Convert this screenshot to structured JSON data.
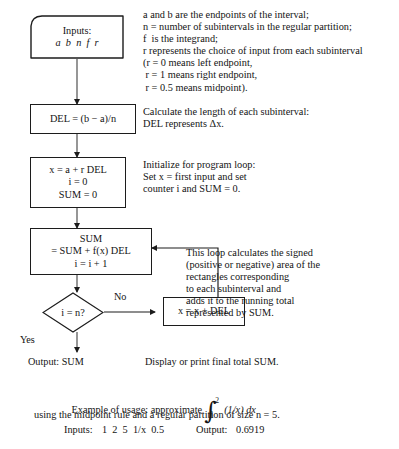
{
  "document": {
    "kind": "flowchart",
    "title": "Riemann sum approximation algorithm flowchart",
    "colors": {
      "background": "#ffffff",
      "ink": "#141414",
      "stroke": "#1c1c1c"
    }
  },
  "flowchart": {
    "nodes": {
      "inputs": {
        "shape": "input-parallelogram",
        "line1": "Inputs:",
        "line2": "a  b  n  f  r"
      },
      "del": {
        "shape": "process",
        "line1": "DEL = (b − a)/n"
      },
      "init": {
        "shape": "process",
        "line1": "x = a + r DEL",
        "line2": "i = 0",
        "line3": "SUM = 0"
      },
      "sum": {
        "shape": "process",
        "line1": "SUM",
        "line2": "= SUM + f(x) DEL",
        "line3": "i = i + 1"
      },
      "test": {
        "shape": "decision",
        "line1": "i = n?"
      },
      "increment": {
        "shape": "process",
        "line1": "x = x + DEL"
      },
      "output": {
        "shape": "terminal-text",
        "line1": "Output: SUM"
      }
    },
    "edge_labels": {
      "no": "No",
      "yes": "Yes"
    }
  },
  "annotations": {
    "legend": [
      "a and b are the endpoints of the interval;",
      "n = number of subintervals in the regular partition;",
      "f  is the integrand;",
      "r represents the choice of input from each subinterval",
      "(r = 0 means left endpoint,",
      " r = 1 means right endpoint,",
      " r = 0.5 means midpoint)."
    ],
    "del_note": [
      "Calculate the length of each subinterval:",
      "DEL represents Δx."
    ],
    "init_note": [
      "Initialize for program loop:",
      "Set x = first input and set",
      "counter i and SUM = 0."
    ],
    "loop_note": [
      "This loop calculates the signed",
      "(positive or negative) area of the",
      "rectangles corresponding",
      "to each subinterval and",
      "adds it to the running total",
      "represented by SUM."
    ],
    "output_note": "Display or print final total SUM."
  },
  "example": {
    "lead": "Example of usage: approximate",
    "integral": {
      "sign": "∫",
      "lower": "1",
      "upper": "2",
      "integrand": "(1/x) dx"
    },
    "line2": "using the midpoint rule and a regular partition of size n = 5.",
    "inputs_label": "Inputs:",
    "inputs_values": "1  2  5  1/x  0.5",
    "output_label": "Output:",
    "output_value": "0.6919"
  }
}
